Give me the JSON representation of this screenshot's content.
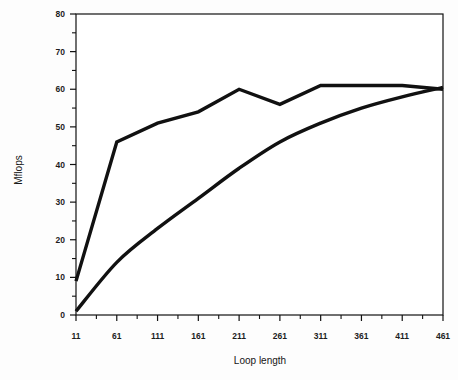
{
  "chart_data": {
    "type": "line",
    "title": "",
    "xlabel": "Loop length",
    "ylabel": "Mflops",
    "xlim": [
      11,
      461
    ],
    "ylim": [
      0,
      80
    ],
    "ytick_values": [
      0,
      10,
      20,
      30,
      40,
      50,
      60,
      70,
      80
    ],
    "ytick_labels": [
      "0",
      "10",
      "20",
      "30",
      "40",
      "50",
      "60",
      "70",
      "80"
    ],
    "yminor_step": 5,
    "xtick_values": [
      11,
      61,
      111,
      161,
      211,
      261,
      311,
      361,
      411,
      461
    ],
    "xtick_labels": [
      "11",
      "61",
      "111",
      "161",
      "211",
      "261",
      "311",
      "361",
      "411",
      "461"
    ],
    "xminor_step": 25,
    "grid": false,
    "legend": "none",
    "x": [
      11,
      61,
      111,
      161,
      211,
      261,
      311,
      361,
      411,
      461
    ],
    "series": [
      {
        "name": "upper-curve",
        "color": "#111111",
        "values": [
          9,
          46,
          51,
          54,
          60,
          56,
          61,
          61,
          61,
          60
        ]
      },
      {
        "name": "lower-curve",
        "color": "#111111",
        "values": [
          1,
          14,
          23,
          31,
          39,
          46,
          51,
          55,
          58,
          60.5
        ]
      }
    ]
  },
  "axes": {
    "y_title": "Mflops",
    "x_title": "Loop length"
  }
}
